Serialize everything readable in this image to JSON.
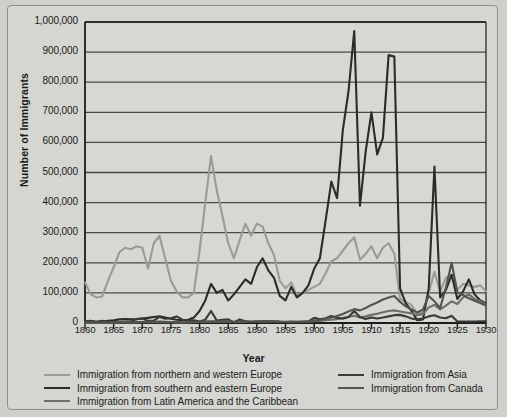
{
  "chart_data": {
    "type": "line",
    "title": "",
    "xlabel": "Year",
    "ylabel": "Number of Immigrants",
    "xlim": [
      1860,
      1930
    ],
    "ylim": [
      0,
      1000000
    ],
    "grid": true,
    "legend_position": "bottom",
    "xticks": [
      1860,
      1865,
      1870,
      1875,
      1880,
      1885,
      1890,
      1895,
      1900,
      1905,
      1910,
      1915,
      1920,
      1925,
      1930
    ],
    "ytick_labels": [
      "0",
      "100,000",
      "200,000",
      "300,000",
      "400,000",
      "500,000",
      "600,000",
      "700,000",
      "800,000",
      "900,000",
      "1,000,000"
    ],
    "yticks": [
      0,
      100000,
      200000,
      300000,
      400000,
      500000,
      600000,
      700000,
      800000,
      900000,
      1000000
    ],
    "x": [
      1860,
      1861,
      1862,
      1863,
      1864,
      1865,
      1866,
      1867,
      1868,
      1869,
      1870,
      1871,
      1872,
      1873,
      1874,
      1875,
      1876,
      1877,
      1878,
      1879,
      1880,
      1881,
      1882,
      1883,
      1884,
      1885,
      1886,
      1887,
      1888,
      1889,
      1890,
      1891,
      1892,
      1893,
      1894,
      1895,
      1896,
      1897,
      1898,
      1899,
      1900,
      1901,
      1902,
      1903,
      1904,
      1905,
      1906,
      1907,
      1908,
      1909,
      1910,
      1911,
      1912,
      1913,
      1914,
      1915,
      1916,
      1917,
      1918,
      1919,
      1920,
      1921,
      1922,
      1923,
      1924,
      1925,
      1926,
      1927,
      1928,
      1929,
      1930
    ],
    "series": [
      {
        "name": "Immigration from northern and western Europe",
        "color": "#9a9a96",
        "width": 2.1,
        "values": [
          135000,
          95000,
          85000,
          88000,
          140000,
          185000,
          235000,
          250000,
          245000,
          255000,
          250000,
          180000,
          265000,
          290000,
          215000,
          140000,
          105000,
          85000,
          85000,
          100000,
          240000,
          400000,
          555000,
          440000,
          355000,
          265000,
          215000,
          275000,
          330000,
          290000,
          330000,
          320000,
          265000,
          225000,
          140000,
          115000,
          135000,
          90000,
          100000,
          110000,
          120000,
          130000,
          165000,
          205000,
          215000,
          240000,
          265000,
          285000,
          210000,
          230000,
          255000,
          215000,
          250000,
          265000,
          230000,
          80000,
          70000,
          60000,
          30000,
          35000,
          100000,
          170000,
          105000,
          150000,
          160000,
          110000,
          130000,
          125000,
          120000,
          125000,
          105000
        ]
      },
      {
        "name": "Immigration from southern and eastern Europe",
        "color": "#2b2b2b",
        "width": 2.1,
        "values": [
          6000,
          5000,
          4000,
          5000,
          7000,
          9000,
          12000,
          13000,
          12000,
          13000,
          15000,
          17000,
          20000,
          22000,
          18000,
          14000,
          11000,
          9000,
          11000,
          18000,
          40000,
          75000,
          130000,
          100000,
          110000,
          75000,
          95000,
          120000,
          145000,
          130000,
          185000,
          215000,
          175000,
          150000,
          90000,
          75000,
          120000,
          85000,
          100000,
          125000,
          180000,
          215000,
          340000,
          470000,
          415000,
          640000,
          770000,
          970000,
          390000,
          570000,
          700000,
          560000,
          615000,
          890000,
          885000,
          115000,
          65000,
          40000,
          9000,
          12000,
          115000,
          520000,
          85000,
          110000,
          160000,
          80000,
          105000,
          145000,
          95000,
          75000,
          65000
        ]
      },
      {
        "name": "Immigration from Latin America and the Caribbean",
        "color": "#6e6e6a",
        "width": 2.1,
        "values": [
          1000,
          900,
          800,
          900,
          1100,
          1400,
          2000,
          2200,
          2000,
          2100,
          2300,
          2600,
          3000,
          3200,
          2800,
          2400,
          2100,
          1900,
          2000,
          2400,
          3200,
          3800,
          4300,
          4200,
          4000,
          3600,
          3400,
          3600,
          4000,
          4200,
          4600,
          5000,
          4700,
          4400,
          3600,
          3400,
          3900,
          3600,
          3900,
          4600,
          6000,
          7000,
          9000,
          11000,
          13000,
          17000,
          20000,
          24000,
          18000,
          22000,
          27000,
          31000,
          36000,
          40000,
          42000,
          38000,
          35000,
          32000,
          26000,
          30000,
          52000,
          60000,
          45000,
          58000,
          72000,
          63000,
          85000,
          95000,
          80000,
          72000,
          62000
        ]
      },
      {
        "name": "Immigration from Asia",
        "color": "#3a3a38",
        "width": 2.1,
        "values": [
          5000,
          7000,
          4000,
          7000,
          3000,
          3000,
          2500,
          3500,
          5000,
          13000,
          15000,
          7000,
          8000,
          20000,
          14000,
          16000,
          22000,
          11000,
          9000,
          9000,
          5000,
          11000,
          40000,
          8000,
          11000,
          12000,
          2000,
          12000,
          6000,
          3000,
          4000,
          5000,
          6000,
          5000,
          4000,
          3000,
          3000,
          3000,
          4000,
          5000,
          17000,
          12000,
          16000,
          23000,
          17000,
          14000,
          20000,
          40000,
          20000,
          13000,
          18000,
          15000,
          18000,
          22000,
          26000,
          27000,
          22000,
          15000,
          12000,
          15000,
          22000,
          26000,
          18000,
          16000,
          24000,
          5000,
          5000,
          5000,
          5000,
          6000,
          6000
        ]
      },
      {
        "name": "Immigration from Canada",
        "color": "#55534f",
        "width": 2.1,
        "values": [
          2000,
          1800,
          1600,
          1800,
          2000,
          2400,
          3000,
          3200,
          3000,
          3200,
          3400,
          3800,
          4300,
          4600,
          4000,
          3400,
          3000,
          2600,
          2800,
          3200,
          4200,
          5000,
          5600,
          5400,
          5000,
          4600,
          4400,
          4600,
          5000,
          5200,
          6000,
          6600,
          6200,
          5800,
          4600,
          4200,
          4800,
          4400,
          4800,
          5600,
          8000,
          10000,
          14000,
          18000,
          23000,
          30000,
          38000,
          46000,
          42000,
          50000,
          60000,
          68000,
          78000,
          85000,
          90000,
          70000,
          55000,
          45000,
          35000,
          45000,
          90000,
          72000,
          50000,
          118000,
          200000,
          102000,
          93000,
          82000,
          74000,
          66000,
          58000
        ]
      }
    ]
  },
  "legend": {
    "left_column": [
      {
        "label": "Immigration from northern and western Europe",
        "color": "#9a9a96"
      },
      {
        "label": "Immigration from southern and eastern Europe",
        "color": "#2b2b2b"
      },
      {
        "label": "Immigration from Latin America and the Caribbean",
        "color": "#6e6e6a"
      }
    ],
    "right_column": [
      {
        "label": "Immigration from Asia",
        "color": "#3a3a38"
      },
      {
        "label": "Immigration from Canada",
        "color": "#55534f"
      }
    ]
  },
  "colors": {
    "background": "#d5d5d1",
    "page": "#cfcfcb",
    "axis": "#1b1b1b",
    "grid": "#4a4a46",
    "text": "#1b1b1b"
  }
}
